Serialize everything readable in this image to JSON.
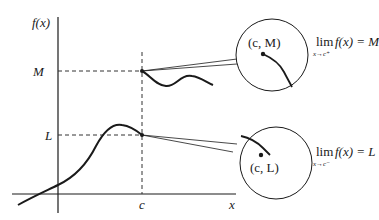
{
  "diagram": {
    "axes": {
      "y_label": "f(x)",
      "x_label": "x",
      "x_tick": "c",
      "y_ticks": [
        "M",
        "L"
      ]
    },
    "upper_inset": {
      "point_label": "(c, M)",
      "limit_word": "lim",
      "limit_sub": "x→c⁺",
      "limit_expr": "f(x) = M"
    },
    "lower_inset": {
      "point_label": "(c, L)",
      "limit_word": "lim",
      "limit_sub": "x→c⁻",
      "limit_expr": "f(x) = L"
    },
    "colors": {
      "stroke": "#1a1a1a",
      "dashed": "#333333",
      "background": "#ffffff"
    }
  }
}
